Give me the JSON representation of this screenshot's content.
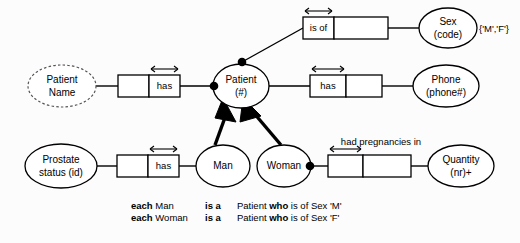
{
  "diagram": {
    "type": "orm-conceptual-schema",
    "background_color": "#fcfcfc",
    "line_color": "#000000"
  },
  "objects": [
    {
      "id": "patient-name",
      "label_line1": "Patient",
      "label_line2": "Name",
      "kind": "value-type",
      "border": "dashed"
    },
    {
      "id": "patient",
      "label_line1": "Patient",
      "label_line2": "(#)",
      "kind": "entity-type",
      "border": "solid"
    },
    {
      "id": "sex",
      "label_line1": "Sex",
      "label_line2": "(code)",
      "kind": "entity-type",
      "border": "solid"
    },
    {
      "id": "phone",
      "label_line1": "Phone",
      "label_line2": "(phone#)",
      "kind": "entity-type",
      "border": "solid"
    },
    {
      "id": "prostate-status",
      "label_line1": "Prostate",
      "label_line2": "status (id)",
      "kind": "entity-type",
      "border": "solid"
    },
    {
      "id": "man",
      "label_line1": "Man",
      "label_line2": "",
      "kind": "subtype",
      "border": "solid"
    },
    {
      "id": "woman",
      "label_line1": "Woman",
      "label_line2": "",
      "kind": "subtype",
      "border": "solid"
    },
    {
      "id": "quantity",
      "label_line1": "Quantity",
      "label_line2": "(nr)+",
      "kind": "entity-type",
      "border": "solid"
    }
  ],
  "fact_types": [
    {
      "id": "patient-has-name",
      "role_label": "has",
      "label_cell": "right",
      "uniqueness_span": "right",
      "external_label": ""
    },
    {
      "id": "patient-is-of-sex",
      "role_label": "is of",
      "label_cell": "left",
      "uniqueness_span": "left",
      "external_label": ""
    },
    {
      "id": "patient-has-phone",
      "role_label": "has",
      "label_cell": "left",
      "uniqueness_span": "left",
      "external_label": ""
    },
    {
      "id": "man-has-prostate-status",
      "role_label": "has",
      "label_cell": "right",
      "uniqueness_span": "right",
      "external_label": ""
    },
    {
      "id": "woman-had-pregnancies-in",
      "role_label": "",
      "label_cell": "none",
      "uniqueness_span": "left",
      "external_label": "had pregnancies in"
    }
  ],
  "constraints": {
    "sex_value_constraint": "{'M','F'}"
  },
  "subtype_definitions": [
    {
      "subject": "each Man",
      "subject_bold_prefix": "each",
      "subject_rest": "Man",
      "verb": "is a",
      "predicate_pre": "Patient ",
      "predicate_bold": "who",
      "predicate_post": " is of Sex 'M'"
    },
    {
      "subject": "each Woman",
      "subject_bold_prefix": "each",
      "subject_rest": "Woman",
      "verb": "is a",
      "predicate_pre": "Patient ",
      "predicate_bold": "who",
      "predicate_post": " is of Sex 'F'"
    }
  ]
}
